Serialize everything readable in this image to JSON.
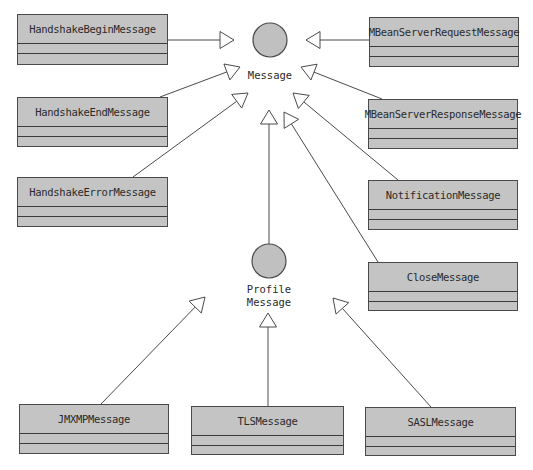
{
  "diagram": {
    "type": "UML class diagram",
    "colors": {
      "box_fill": "#c4c4c4",
      "box_border": "#4a4a4a",
      "interface_fill": "#c0c0c0",
      "line": "#4a4a4a",
      "text": "#2a2a2a"
    },
    "interfaces": [
      {
        "id": "message",
        "label_lines": [
          "Message"
        ],
        "cx": 270,
        "cy": 40,
        "r": 17,
        "label_y": 69
      },
      {
        "id": "profile_message",
        "label_lines": [
          "Profile",
          "Message"
        ],
        "cx": 269,
        "cy": 261,
        "r": 17,
        "label_y": 283
      }
    ],
    "classes": [
      {
        "id": "handshake_begin",
        "name": "HandshakeBeginMessage",
        "x": 17,
        "y": 14,
        "w": 151,
        "h": 51
      },
      {
        "id": "handshake_end",
        "name": "HandshakeEndMessage",
        "x": 17,
        "y": 97,
        "w": 151,
        "h": 50
      },
      {
        "id": "handshake_error",
        "name": "HandshakeErrorMessage",
        "x": 17,
        "y": 177,
        "w": 151,
        "h": 50
      },
      {
        "id": "mbean_request",
        "name": "MBeanServerRequestMessage",
        "x": 369,
        "y": 17,
        "w": 150,
        "h": 50
      },
      {
        "id": "mbean_response",
        "name": "MBeanServerResponseMessage",
        "x": 368,
        "y": 99,
        "w": 150,
        "h": 50
      },
      {
        "id": "notification",
        "name": "NotificationMessage",
        "x": 368,
        "y": 180,
        "w": 150,
        "h": 50
      },
      {
        "id": "close",
        "name": "CloseMessage",
        "x": 368,
        "y": 262,
        "w": 150,
        "h": 49
      },
      {
        "id": "jmxmp",
        "name": "JMXMPMessage",
        "x": 19,
        "y": 404,
        "w": 150,
        "h": 50
      },
      {
        "id": "tls",
        "name": "TLSMessage",
        "x": 191,
        "y": 406,
        "w": 153,
        "h": 49
      },
      {
        "id": "sasl",
        "name": "SASLMessage",
        "x": 365,
        "y": 407,
        "w": 151,
        "h": 49
      }
    ],
    "generalizations": [
      {
        "from": "handshake_begin",
        "to": "message",
        "x1": 168,
        "y1": 40,
        "x2": 234,
        "y2": 40
      },
      {
        "from": "handshake_end",
        "to": "message",
        "x1": 160,
        "y1": 97,
        "x2": 240,
        "y2": 67
      },
      {
        "from": "handshake_error",
        "to": "message",
        "x1": 133,
        "y1": 177,
        "x2": 248,
        "y2": 93
      },
      {
        "from": "mbean_request",
        "to": "message",
        "x1": 369,
        "y1": 40,
        "x2": 306,
        "y2": 40
      },
      {
        "from": "mbean_response",
        "to": "message",
        "x1": 382,
        "y1": 99,
        "x2": 301,
        "y2": 67
      },
      {
        "from": "notification",
        "to": "message",
        "x1": 398,
        "y1": 180,
        "x2": 293,
        "y2": 93
      },
      {
        "from": "close",
        "to": "message",
        "x1": 378,
        "y1": 262,
        "x2": 284,
        "y2": 112
      },
      {
        "from": "profile_message",
        "to": "message",
        "x1": 269,
        "y1": 244,
        "x2": 269,
        "y2": 110
      },
      {
        "from": "jmxmp",
        "to": "profile_message",
        "x1": 101,
        "y1": 404,
        "x2": 205,
        "y2": 297
      },
      {
        "from": "tls",
        "to": "profile_message",
        "x1": 268,
        "y1": 406,
        "x2": 268,
        "y2": 313
      },
      {
        "from": "sasl",
        "to": "profile_message",
        "x1": 431,
        "y1": 407,
        "x2": 333,
        "y2": 298
      }
    ]
  }
}
